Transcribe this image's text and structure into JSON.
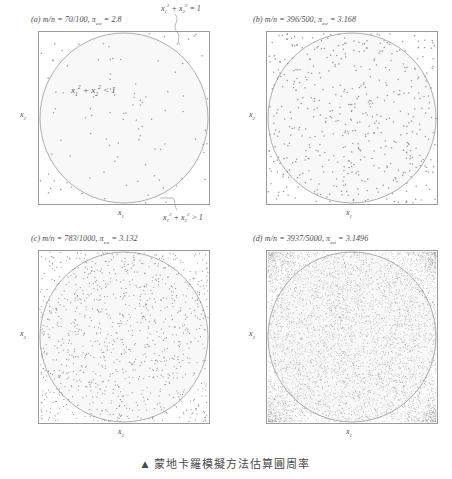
{
  "figure": {
    "caption_marker": "▲",
    "caption_text": "蒙地卡羅模擬方法估算圓周率",
    "axis_x_label_html": "x<sub>1</sub>",
    "axis_y_label_html": "x<sub>2</sub>",
    "colors": {
      "box_border": "#9a9a9a",
      "circle_stroke": "#9a9a9a",
      "point": "#8c8c8c",
      "text": "#4a4a4a",
      "fill_inside": "#fbfbfb"
    }
  },
  "annotations": {
    "circle_eq_html": "x<sub>1</sub><sup>2</sup> + x<sub>2</sub><sup>2</sup> = 1",
    "inside_eq_html": "x<sub>1</sub><sup>2</sup> + x<sub>2</sub><sup>2</sup> &lt; 1",
    "outside_eq_html": "x<sub>1</sub><sup>2</sup> + x<sub>2</sub><sup>2</sup> &gt; 1"
  },
  "panels": [
    {
      "id": "a",
      "label": "(a)",
      "ratio_label": "m/n",
      "m": 70,
      "n": 100,
      "ratio_text": "70/100",
      "pi_symbol": "π",
      "pi_subscript": "est",
      "pi_value": "2.8",
      "caption_html": "(a) <i>m</i>/<i>n</i> = 70/100, &pi;<sub>est</sub> = 2.8",
      "seed": 11
    },
    {
      "id": "b",
      "label": "(b)",
      "ratio_label": "m/n",
      "m": 396,
      "n": 500,
      "ratio_text": "396/500",
      "pi_symbol": "π",
      "pi_subscript": "est",
      "pi_value": "3.168",
      "caption_html": "(b) <i>m</i>/<i>n</i> = 396/500, &pi;<sub>est</sub> = 3.168",
      "seed": 23
    },
    {
      "id": "c",
      "label": "(c)",
      "ratio_label": "m/n",
      "m": 783,
      "n": 1000,
      "ratio_text": "783/1000",
      "pi_symbol": "π",
      "pi_subscript": "est",
      "pi_value": "3.132",
      "caption_html": "(c) <i>m</i>/<i>n</i> = 783/1000, &pi;<sub>est</sub> = 3.132",
      "seed": 37
    },
    {
      "id": "d",
      "label": "(d)",
      "ratio_label": "m/n",
      "m": 3937,
      "n": 5000,
      "ratio_text": "3937/5000",
      "pi_symbol": "π",
      "pi_subscript": "est",
      "pi_value": "3.1496",
      "caption_html": "(d) <i>m</i>/<i>n</i> = 3937/5000, &pi;<sub>est</sub> = 3.1496",
      "seed": 59
    }
  ],
  "chart_data": {
    "type": "scatter",
    "title": "蒙地卡羅模擬方法估算圓周率",
    "xlabel": "x_1",
    "ylabel": "x_2",
    "xlim": [
      -1,
      1
    ],
    "ylim": [
      -1,
      1
    ],
    "grid": false,
    "legend": "none",
    "overlay_curve": "unit circle x_1^2 + x_2^2 = 1",
    "region_labels": [
      "x_1^2 + x_2^2 < 1",
      "x_1^2 + x_2^2 > 1"
    ],
    "subplots": [
      {
        "panel": "a",
        "n_points": 100,
        "m_inside": 70,
        "pi_estimate": 2.8
      },
      {
        "panel": "b",
        "n_points": 500,
        "m_inside": 396,
        "pi_estimate": 3.168
      },
      {
        "panel": "c",
        "n_points": 1000,
        "m_inside": 783,
        "pi_estimate": 3.132
      },
      {
        "panel": "d",
        "n_points": 5000,
        "m_inside": 3937,
        "pi_estimate": 3.1496
      }
    ]
  }
}
